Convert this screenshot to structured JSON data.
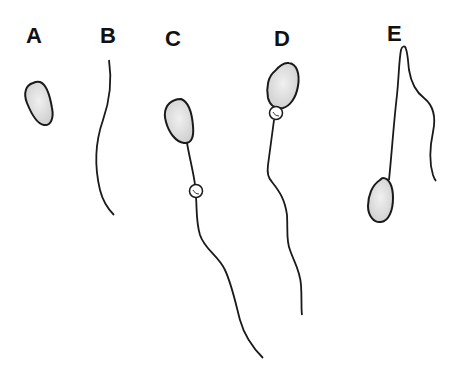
{
  "panels": [
    {
      "id": "A",
      "label": "A",
      "description": "isolated head"
    },
    {
      "id": "B",
      "label": "B",
      "description": "isolated tail"
    },
    {
      "id": "C",
      "label": "C",
      "description": "head with tail, droplet mid-tail"
    },
    {
      "id": "D",
      "label": "D",
      "description": "head with tail, droplet near neck"
    },
    {
      "id": "E",
      "label": "E",
      "description": "head with tail bent/coiled at tip"
    }
  ],
  "colors": {
    "outline": "#1a1a1a",
    "head_fill": "#d4d4d4",
    "head_highlight": "#efefef",
    "background": "#ffffff"
  }
}
